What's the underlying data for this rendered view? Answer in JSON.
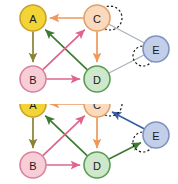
{
  "figure": {
    "type": "directed-graph-sequence",
    "background": "#ffffff",
    "panel_count": 2
  },
  "palette": {
    "node_a_fill": "#f2d437",
    "node_a_stroke": "#c9a227",
    "node_b_fill": "#f7cdd8",
    "node_b_stroke": "#d9849c",
    "node_c_fill": "#fbd9bd",
    "node_c_stroke": "#e0a16a",
    "node_d_fill": "#cfe8cb",
    "node_d_stroke": "#5a9e56",
    "node_e_fill": "#c3cfe8",
    "node_e_stroke": "#7f93c0",
    "edge_orange": "#f0975a",
    "edge_olive": "#8a8236",
    "edge_green": "#3f7a33",
    "edge_pink": "#e0648a",
    "edge_gray": "#a8aeb8",
    "edge_blue": "#3a5fa8",
    "highlight_dash": "#1a1a1a",
    "label_color": "#1a1a1a"
  },
  "nodes": [
    {
      "id": "A",
      "label": "A",
      "x": 33,
      "y": 18,
      "r": 13,
      "fill_key": "node_a_fill",
      "stroke_key": "node_a_stroke"
    },
    {
      "id": "B",
      "label": "B",
      "x": 33,
      "y": 79,
      "r": 13,
      "fill_key": "node_b_fill",
      "stroke_key": "node_b_stroke"
    },
    {
      "id": "C",
      "label": "C",
      "x": 97,
      "y": 18,
      "r": 13,
      "fill_key": "node_c_fill",
      "stroke_key": "node_c_stroke"
    },
    {
      "id": "D",
      "label": "D",
      "x": 97,
      "y": 79,
      "r": 13,
      "fill_key": "node_d_fill",
      "stroke_key": "node_d_stroke"
    },
    {
      "id": "E",
      "label": "E",
      "x": 156,
      "y": 49,
      "r": 13,
      "fill_key": "node_e_fill",
      "stroke_key": "node_e_stroke"
    }
  ],
  "panel_top": {
    "name": "graph-frame-1",
    "edges": [
      {
        "from": "C",
        "to": "A",
        "color_key": "edge_orange",
        "directed": true,
        "name": "edge-c-to-a"
      },
      {
        "from": "A",
        "to": "B",
        "color_key": "edge_olive",
        "directed": true,
        "name": "edge-a-to-b"
      },
      {
        "from": "B",
        "to": "D",
        "color_key": "edge_pink",
        "directed": true,
        "name": "edge-b-to-d"
      },
      {
        "from": "C",
        "to": "D",
        "color_key": "edge_orange",
        "directed": true,
        "name": "edge-c-to-d"
      },
      {
        "from": "D",
        "to": "A",
        "color_key": "edge_green",
        "directed": true,
        "name": "edge-d-to-a"
      },
      {
        "from": "B",
        "to": "C",
        "color_key": "edge_pink",
        "directed": true,
        "name": "edge-b-to-c"
      },
      {
        "from": "C",
        "to": "E",
        "color_key": "edge_gray",
        "directed": false,
        "name": "edge-c-e"
      },
      {
        "from": "D",
        "to": "E",
        "color_key": "edge_gray",
        "directed": false,
        "name": "edge-d-e"
      }
    ],
    "highlights": [
      {
        "x": 110,
        "y": 18,
        "r": 12,
        "name": "highlight-circle-c"
      },
      {
        "x": 143,
        "y": 56,
        "r": 10,
        "name": "highlight-circle-e"
      }
    ]
  },
  "panel_bottom": {
    "name": "graph-frame-2",
    "edges": [
      {
        "from": "C",
        "to": "A",
        "color_key": "edge_orange",
        "directed": true,
        "name": "edge-c-to-a"
      },
      {
        "from": "A",
        "to": "B",
        "color_key": "edge_olive",
        "directed": true,
        "name": "edge-a-to-b"
      },
      {
        "from": "B",
        "to": "D",
        "color_key": "edge_pink",
        "directed": true,
        "name": "edge-b-to-d"
      },
      {
        "from": "C",
        "to": "D",
        "color_key": "edge_orange",
        "directed": true,
        "name": "edge-c-to-d"
      },
      {
        "from": "D",
        "to": "A",
        "color_key": "edge_green",
        "directed": true,
        "name": "edge-d-to-a"
      },
      {
        "from": "B",
        "to": "C",
        "color_key": "edge_pink",
        "directed": true,
        "name": "edge-b-to-c"
      },
      {
        "from": "E",
        "to": "C",
        "color_key": "edge_blue",
        "directed": true,
        "name": "edge-e-to-c-new"
      },
      {
        "from": "D",
        "to": "E",
        "color_key": "edge_green",
        "directed": true,
        "name": "edge-d-to-e-new"
      }
    ],
    "highlights": [
      {
        "x": 110,
        "y": 18,
        "r": 12,
        "name": "highlight-circle-c"
      },
      {
        "x": 143,
        "y": 56,
        "r": 10,
        "name": "highlight-circle-e"
      }
    ],
    "y_offset": -18
  }
}
